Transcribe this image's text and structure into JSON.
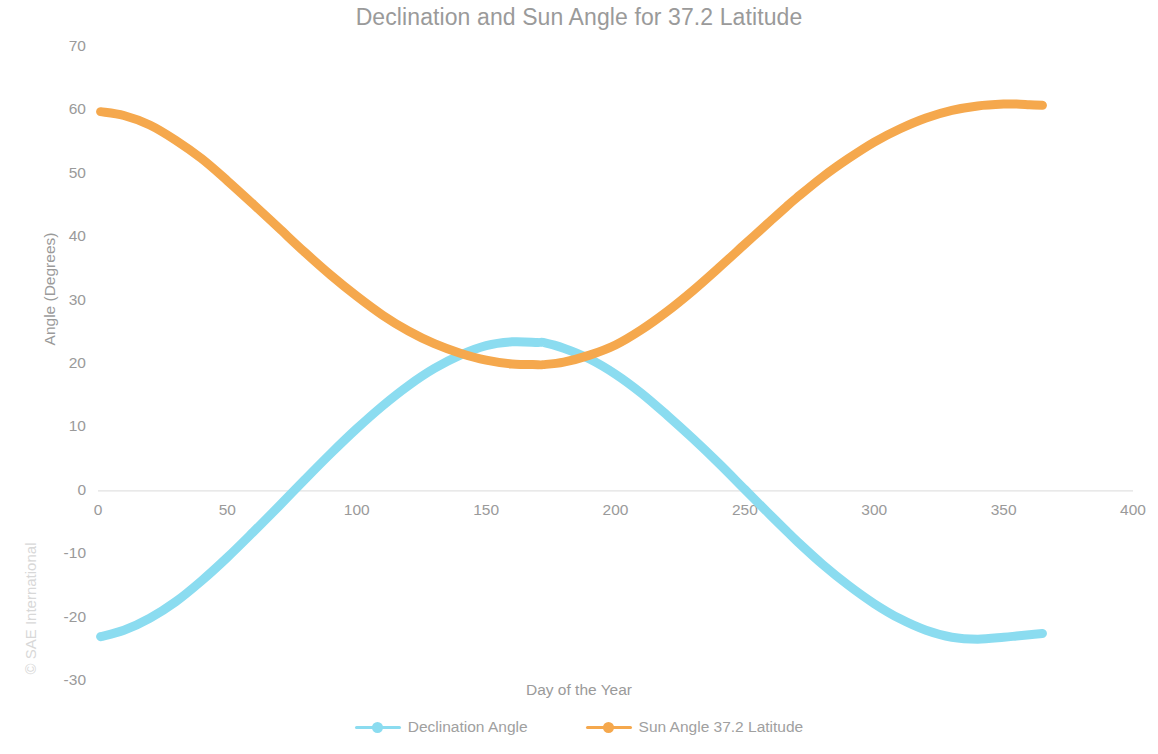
{
  "chart_data": {
    "type": "line",
    "title": "Declination and Sun Angle for 37.2 Latitude",
    "xlabel": "Day of the Year",
    "ylabel": "Angle (Degrees)",
    "xlim": [
      0,
      400
    ],
    "ylim": [
      -30,
      70
    ],
    "xticks": [
      "0",
      "50",
      "100",
      "150",
      "200",
      "250",
      "300",
      "350",
      "400"
    ],
    "yticks": [
      "70",
      "60",
      "50",
      "40",
      "30",
      "20",
      "10",
      "0",
      "-10",
      "-20",
      "-30"
    ],
    "grid": false,
    "legend_position": "bottom",
    "marker": "circle",
    "series": [
      {
        "name": "Declination Angle",
        "color": "#8BDCF0",
        "x": [
          1,
          10,
          20,
          30,
          40,
          50,
          60,
          70,
          80,
          90,
          100,
          110,
          120,
          130,
          140,
          150,
          160,
          170,
          172,
          180,
          190,
          200,
          210,
          220,
          230,
          240,
          250,
          260,
          266,
          270,
          280,
          290,
          300,
          310,
          320,
          330,
          340,
          350,
          355,
          360,
          365
        ],
        "values": [
          -23.0,
          -22.0,
          -20.1,
          -17.5,
          -14.2,
          -10.5,
          -6.5,
          -2.4,
          1.8,
          5.9,
          9.8,
          13.4,
          16.6,
          19.3,
          21.4,
          22.9,
          23.5,
          23.4,
          23.4,
          22.5,
          20.8,
          18.4,
          15.4,
          11.9,
          8.2,
          4.3,
          0.2,
          -3.9,
          -6.3,
          -7.9,
          -11.6,
          -14.9,
          -17.8,
          -20.2,
          -22.0,
          -23.1,
          -23.4,
          -23.1,
          -22.9,
          -22.7,
          -22.5
        ]
      },
      {
        "name": "Sun Angle 37.2 Latitude",
        "color": "#F5A84D",
        "x": [
          1,
          10,
          20,
          30,
          40,
          50,
          60,
          70,
          80,
          90,
          100,
          110,
          120,
          130,
          140,
          150,
          160,
          170,
          172,
          180,
          190,
          200,
          210,
          220,
          230,
          240,
          250,
          260,
          266,
          270,
          280,
          290,
          300,
          310,
          320,
          330,
          340,
          350,
          355,
          360,
          365
        ],
        "values": [
          59.8,
          59.2,
          57.7,
          55.3,
          52.4,
          48.9,
          45.2,
          41.4,
          37.6,
          34.0,
          30.7,
          27.7,
          25.2,
          23.2,
          21.7,
          20.6,
          20.0,
          19.9,
          19.9,
          20.3,
          21.4,
          23.0,
          25.4,
          28.3,
          31.6,
          35.2,
          38.9,
          42.6,
          44.8,
          46.2,
          49.5,
          52.4,
          55.0,
          57.1,
          58.8,
          60.0,
          60.7,
          61.0,
          61.0,
          60.9,
          60.8
        ]
      }
    ]
  },
  "watermark": {
    "text": "© SAE International"
  }
}
